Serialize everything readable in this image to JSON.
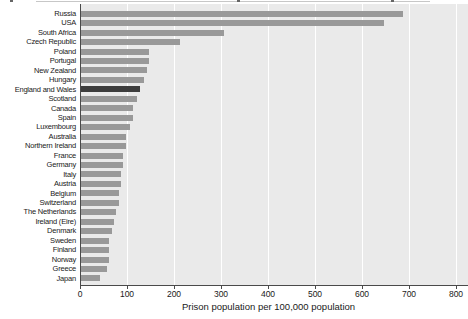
{
  "chart_data": {
    "type": "bar",
    "orientation": "horizontal",
    "xlabel": "Prison population per 100,000 population",
    "xlim": [
      0,
      800
    ],
    "xticks": [
      0,
      100,
      200,
      300,
      400,
      500,
      600,
      700,
      800
    ],
    "legend": "none",
    "grid": "vertical-white-gridlines-on-gray-panel",
    "highlight_category": "England and Wales",
    "categories": [
      "Russia",
      "USA",
      "South Africa",
      "Czech Republic",
      "Poland",
      "Portugal",
      "New Zealand",
      "Hungary",
      "England and Wales",
      "Scotland",
      "Canada",
      "Spain",
      "Luxembourg",
      "Australia",
      "Northern Ireland",
      "France",
      "Germany",
      "Italy",
      "Austria",
      "Belgium",
      "Switzerland",
      "The Netherlands",
      "Ireland (Eire)",
      "Denmark",
      "Sweden",
      "Finland",
      "Norway",
      "Greece",
      "Japan"
    ],
    "values": [
      685,
      645,
      305,
      210,
      145,
      145,
      140,
      135,
      125,
      120,
      110,
      110,
      105,
      95,
      95,
      90,
      90,
      85,
      85,
      80,
      80,
      75,
      70,
      65,
      60,
      60,
      60,
      55,
      40
    ],
    "colors": {
      "bar": "#999999",
      "highlight_bar": "#3d3d3d",
      "panel_background": "#eaeaea",
      "gridline": "#ffffff",
      "axis": "#4a4a4a",
      "text": "#1a1a1a"
    }
  }
}
